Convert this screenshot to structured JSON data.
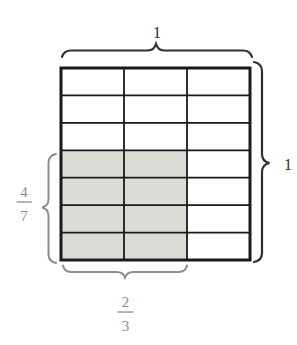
{
  "figure": {
    "grid": {
      "rows": 7,
      "cols": 3,
      "shaded_rows_from_bottom": 4,
      "shaded_cols_from_left": 2,
      "shade_color": "#dcdcd7",
      "cell_color": "#ffffff",
      "line_color": "#1a1a1a"
    },
    "labels": {
      "top_width": "1",
      "right_height": "1",
      "left_fraction": {
        "numerator": "4",
        "denominator": "7"
      },
      "bottom_fraction": {
        "numerator": "2",
        "denominator": "3"
      }
    },
    "colors": {
      "dark_brace": "#2e2e2e",
      "gray_brace": "#8d8d8d",
      "dark_label": "#2b2b2b",
      "gray_label": "#8d8a86"
    }
  }
}
